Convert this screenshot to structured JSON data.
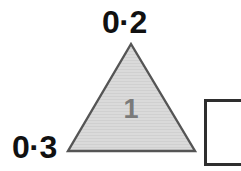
{
  "page": {
    "background_color": "#ffffff"
  },
  "diagram": {
    "shape": "triangle",
    "fill_color": "#d8d8d8",
    "stroke_color": "#555555",
    "inner_value": "1",
    "inner_value_color": "#7a7a7a",
    "vertices": {
      "apex": [
        131,
        44
      ],
      "base_left": [
        68,
        151
      ],
      "base_right": [
        195,
        151
      ]
    }
  },
  "labels": {
    "top": "0·2",
    "left": "0·3",
    "color": "#111111"
  },
  "answer_box": {
    "value": "",
    "placeholder": "",
    "border_color": "#2e2e2e",
    "fill_color": "#ffffff"
  }
}
